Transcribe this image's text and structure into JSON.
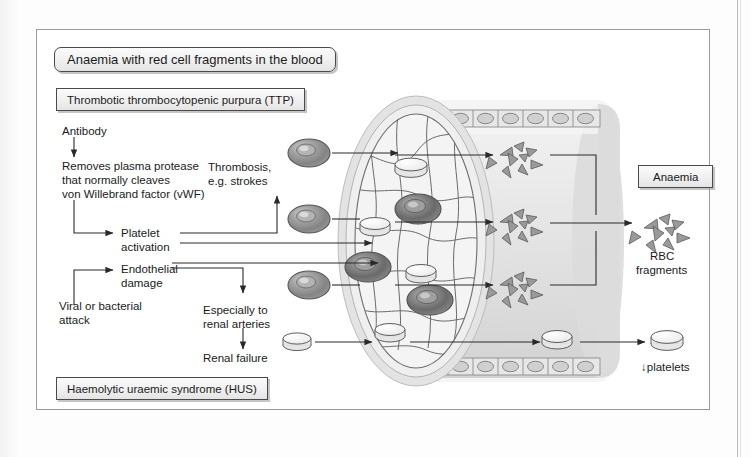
{
  "figure": {
    "title": "Anaemia with red cell fragments in the blood",
    "boxes": {
      "ttp": "Thrombotic thrombocytopenic purpura (TTP)",
      "hus": "Haemolytic uraemic syndrome (HUS)",
      "anaemia": "Anaemia"
    },
    "labels": {
      "antibody": "Antibody",
      "removes_line1": "Removes plasma protease",
      "removes_line2": "that normally cleaves",
      "removes_line3": "von Willebrand factor (vWF)",
      "thrombosis_line1": "Thrombosis,",
      "thrombosis_line2": "e.g. strokes",
      "platelet_line1": "Platelet",
      "platelet_line2": "activation",
      "endothelial_line1": "Endothelial",
      "endothelial_line2": "damage",
      "viral_line1": "Viral or bacterial",
      "viral_line2": "attack",
      "especially_line1": "Especially to",
      "especially_line2": "renal arteries",
      "renal_failure": "Renal failure",
      "rbc_line1": "RBC",
      "rbc_line2": "fragments",
      "platelets_down": "↓platelets"
    },
    "colors": {
      "ink": "#1b1b1b",
      "line": "#3a3a3a",
      "vessel_wall": "#cfcfcf",
      "vessel_lumen": "#e8e8e8",
      "rbc_dark": "#6f6f6f",
      "platelet_fill": "#f6f6f6",
      "frame": "#9a9a9a"
    },
    "vessel": {
      "endothelial_cell_count_top": 8,
      "endothelial_cell_count_bottom": 8,
      "rbc_inside_count": 3,
      "platelet_inside_count": 3,
      "rbc_entering_count": 3,
      "platelet_entering_count": 1,
      "fragment_cluster_count": 3
    }
  }
}
